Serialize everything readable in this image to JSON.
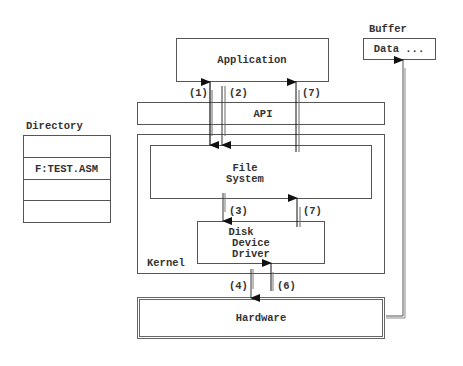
{
  "diagram": {
    "application": {
      "label": "Application"
    },
    "api": {
      "label": "API"
    },
    "kernel": {
      "label": "Kernel"
    },
    "file_system": {
      "label_line1": "File",
      "label_line2": "System"
    },
    "driver": {
      "label_line1": "Disk",
      "label_line2": "Device",
      "label_line3": "Driver"
    },
    "hardware": {
      "label": "Hardware"
    },
    "buffer": {
      "title": "Buffer",
      "content": "Data ..."
    },
    "directory": {
      "title": "Directory",
      "rows": [
        "",
        "F:TEST.ASM",
        "",
        ""
      ]
    },
    "steps": {
      "s1": "(1)",
      "s2": "(2)",
      "s3": "(3)",
      "s4": "(4)",
      "s6": "(6)",
      "s7_top": "(7)",
      "s7_mid": "(7)"
    }
  }
}
